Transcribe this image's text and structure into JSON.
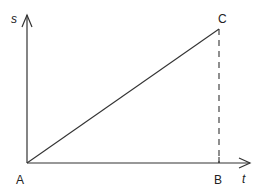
{
  "diagram": {
    "type": "s-t graph",
    "axes": {
      "y_label": "s",
      "x_label": "t"
    },
    "points": {
      "origin": "A",
      "end_point": "C",
      "foot_point": "B"
    },
    "colors": {
      "stroke": "#333333",
      "background": "#ffffff"
    }
  }
}
